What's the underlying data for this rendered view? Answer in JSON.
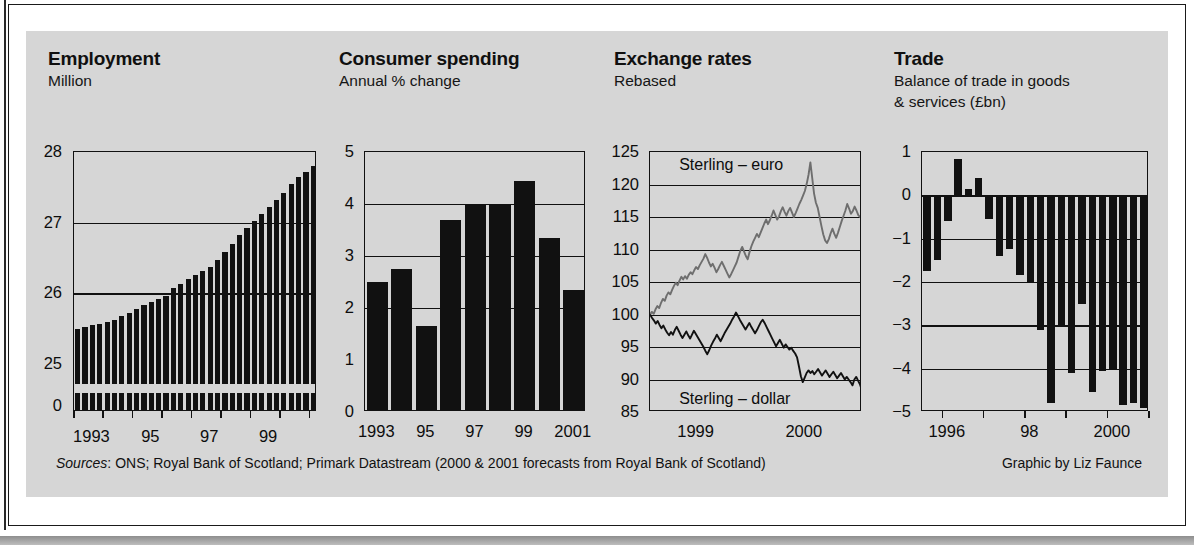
{
  "footer": {
    "sources_label": "Sources",
    "sources_text": ": ONS; Royal Bank of Scotland; Primark Datastream (2000 & 2001 forecasts from Royal Bank of Scotland)",
    "credit": "Graphic by Liz Faunce"
  },
  "colors": {
    "panel_background": "#d6d6d6",
    "ink": "#111111",
    "sterling_euro_line": "#6e6e6e",
    "sterling_dollar_line": "#111111",
    "page_background": "#ffffff"
  },
  "chart_data": [
    {
      "id": "employment",
      "type": "bar",
      "title": "Employment",
      "subtitle": "Million",
      "ylabel": "Million",
      "xlabel": "",
      "ylim": [
        24.5,
        28
      ],
      "broken_axis": true,
      "baseline_label": "0",
      "ytick_labels": [
        "28",
        "27",
        "26",
        "25",
        "0"
      ],
      "ytick_values": [
        28,
        27,
        26,
        25,
        0
      ],
      "gridlines": [
        27,
        26
      ],
      "xtick_labels": [
        "1993",
        "95",
        "97",
        "99"
      ],
      "xtick_positions": [
        2,
        10,
        18,
        26
      ],
      "categories": [
        "1992Q4",
        "1993Q1",
        "1993Q2",
        "1993Q3",
        "1993Q4",
        "1994Q1",
        "1994Q2",
        "1994Q3",
        "1994Q4",
        "1995Q1",
        "1995Q2",
        "1995Q3",
        "1995Q4",
        "1996Q1",
        "1996Q2",
        "1996Q3",
        "1996Q4",
        "1997Q1",
        "1997Q2",
        "1997Q3",
        "1997Q4",
        "1998Q1",
        "1998Q2",
        "1998Q3",
        "1998Q4",
        "1999Q1",
        "1999Q2",
        "1999Q3",
        "1999Q4",
        "2000Q1",
        "2000Q2",
        "2000Q3",
        "2000Q4"
      ],
      "values": [
        25.5,
        25.52,
        25.55,
        25.57,
        25.6,
        25.63,
        25.68,
        25.72,
        25.78,
        25.83,
        25.88,
        25.92,
        25.97,
        26.08,
        26.14,
        26.2,
        26.26,
        26.32,
        26.38,
        26.48,
        26.58,
        26.7,
        26.82,
        26.92,
        27.02,
        27.12,
        27.22,
        27.32,
        27.42,
        27.55,
        27.64,
        27.72,
        27.8
      ]
    },
    {
      "id": "consumer-spending",
      "type": "bar",
      "title": "Consumer spending",
      "subtitle": "Annual % change",
      "ylabel": "Annual % change",
      "xlabel": "",
      "ylim": [
        0,
        5
      ],
      "ytick_labels": [
        "5",
        "4",
        "3",
        "2",
        "1",
        "0"
      ],
      "ytick_values": [
        5,
        4,
        3,
        2,
        1,
        0
      ],
      "gridlines": [
        4,
        3,
        2
      ],
      "xtick_labels": [
        "1993",
        "95",
        "97",
        "99",
        "2001"
      ],
      "xtick_positions": [
        0,
        2,
        4,
        6,
        8
      ],
      "categories": [
        "1993",
        "1994",
        "1995",
        "1996",
        "1997",
        "1998",
        "1999",
        "2000",
        "2001"
      ],
      "values": [
        2.5,
        2.75,
        1.65,
        3.7,
        4.0,
        4.0,
        4.45,
        3.35,
        2.35
      ]
    },
    {
      "id": "exchange-rates",
      "type": "line",
      "title": "Exchange rates",
      "subtitle": "Rebased",
      "ylabel": "Rebased",
      "xlabel": "",
      "ylim": [
        85,
        125
      ],
      "ytick_labels": [
        "125",
        "120",
        "115",
        "110",
        "105",
        "100",
        "95",
        "90",
        "85"
      ],
      "ytick_values": [
        125,
        120,
        115,
        110,
        105,
        100,
        95,
        90,
        85
      ],
      "gridlines": [
        120,
        115,
        110,
        105,
        100,
        95,
        90
      ],
      "xtick_labels": [
        "1999",
        "2000"
      ],
      "xtick_positions": [
        0.22,
        0.73
      ],
      "annotations": [
        {
          "text": "Sterling – euro",
          "x": 0.1,
          "y": 123
        },
        {
          "text": "Sterling – dollar",
          "x": 0.1,
          "y": 87
        }
      ],
      "series": [
        {
          "name": "Sterling – euro",
          "color": "#6e6e6e",
          "values": [
            100.0,
            100.4,
            100.1,
            100.8,
            101.3,
            101.0,
            101.8,
            102.4,
            102.1,
            102.9,
            103.4,
            103.1,
            103.8,
            104.4,
            104.9,
            104.5,
            105.2,
            105.8,
            105.4,
            105.9,
            105.5,
            106.1,
            106.5,
            106.2,
            106.8,
            107.3,
            107.0,
            107.6,
            108.1,
            108.6,
            109.3,
            108.7,
            108.0,
            107.4,
            107.8,
            107.2,
            106.5,
            107.0,
            107.6,
            108.1,
            107.5,
            106.9,
            106.3,
            105.7,
            106.2,
            106.8,
            107.4,
            108.0,
            108.9,
            109.8,
            110.4,
            109.7,
            109.0,
            108.5,
            109.6,
            110.5,
            111.2,
            111.8,
            112.4,
            111.9,
            112.6,
            113.3,
            114.0,
            114.6,
            113.9,
            114.5,
            115.2,
            116.0,
            115.3,
            114.6,
            115.1,
            115.9,
            116.5,
            115.8,
            115.2,
            115.9,
            116.4,
            115.7,
            115.0,
            115.6,
            116.3,
            117.0,
            117.6,
            118.3,
            119.0,
            120.1,
            121.5,
            123.4,
            121.0,
            118.6,
            117.2,
            116.4,
            115.0,
            113.6,
            112.3,
            111.4,
            111.0,
            111.6,
            112.5,
            113.2,
            112.4,
            111.8,
            112.6,
            113.5,
            114.4,
            115.2,
            116.0,
            117.0,
            116.3,
            115.5,
            115.9,
            116.6,
            116.0,
            115.3,
            115.0,
            115.4
          ]
        },
        {
          "name": "Sterling – dollar",
          "color": "#111111",
          "values": [
            100.0,
            99.5,
            99.1,
            98.6,
            99.0,
            98.4,
            97.9,
            98.3,
            97.7,
            97.2,
            96.8,
            97.3,
            96.9,
            97.6,
            98.1,
            97.5,
            96.9,
            96.4,
            96.9,
            97.4,
            96.8,
            96.3,
            96.9,
            97.5,
            97.0,
            96.5,
            96.0,
            95.5,
            95.0,
            94.4,
            93.9,
            94.5,
            95.2,
            95.8,
            96.3,
            96.9,
            96.4,
            95.9,
            96.5,
            97.1,
            97.6,
            98.1,
            98.6,
            99.2,
            99.7,
            100.3,
            99.8,
            99.2,
            98.7,
            98.2,
            97.7,
            98.2,
            98.7,
            98.1,
            97.6,
            97.1,
            97.6,
            98.2,
            98.8,
            99.2,
            98.7,
            98.1,
            97.5,
            96.9,
            96.3,
            95.7,
            95.1,
            95.6,
            96.1,
            95.5,
            94.9,
            95.4,
            95.0,
            94.6,
            94.9,
            94.4,
            94.0,
            93.4,
            92.0,
            90.5,
            89.6,
            90.3,
            91.0,
            91.4,
            91.0,
            91.3,
            90.8,
            91.2,
            91.6,
            91.1,
            90.6,
            91.0,
            91.4,
            90.9,
            90.4,
            90.8,
            91.2,
            90.7,
            90.2,
            90.6,
            91.0,
            90.5,
            90.0,
            90.4,
            90.0,
            89.6,
            89.1,
            90.0,
            90.4,
            89.8,
            89.2,
            88.3
          ]
        }
      ]
    },
    {
      "id": "trade",
      "type": "bar",
      "title": "Trade",
      "subtitle": "Balance of trade in goods\n& services (£bn)",
      "subtitle_line1": "Balance of trade in goods",
      "subtitle_line2": "& services (£bn)",
      "ylabel": "£bn",
      "xlabel": "",
      "ylim": [
        -5,
        1
      ],
      "ytick_labels": [
        "1",
        "0",
        "−1",
        "−2",
        "−3",
        "−4",
        "−5"
      ],
      "ytick_values": [
        1,
        0,
        -1,
        -2,
        -3,
        -4,
        -5
      ],
      "gridlines": [
        -1,
        -2,
        -3,
        -4
      ],
      "zero_line": 0,
      "xtick_labels": [
        "1996",
        "98",
        "2000"
      ],
      "xtick_positions": [
        2,
        10,
        18
      ],
      "categories": [
        "1995Q3",
        "1995Q4",
        "1996Q1",
        "1996Q2",
        "1996Q3",
        "1996Q4",
        "1997Q1",
        "1997Q2",
        "1997Q3",
        "1997Q4",
        "1998Q1",
        "1998Q2",
        "1998Q3",
        "1998Q4",
        "1999Q1",
        "1999Q2",
        "1999Q3",
        "1999Q4",
        "2000Q1",
        "2000Q2",
        "2000Q3",
        "2000Q4"
      ],
      "values": [
        -1.75,
        -1.5,
        -0.6,
        0.85,
        0.15,
        0.4,
        -0.55,
        -1.4,
        -1.25,
        -1.85,
        -2.0,
        -3.1,
        -4.8,
        -3.05,
        -4.1,
        -2.5,
        -4.55,
        -4.05,
        -4.0,
        -4.85,
        -4.8,
        -4.9
      ]
    }
  ]
}
